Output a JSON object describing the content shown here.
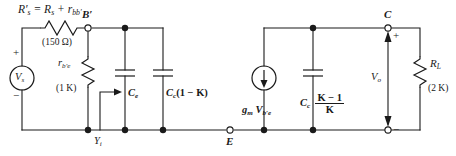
{
  "figure": {
    "kind": "circuit-schematic",
    "title_text": "",
    "background_color": "#ffffff",
    "ink_color": "#1a1a1a"
  },
  "source": {
    "name": "V",
    "sub": "s",
    "plus_sign": "+",
    "minus_sign": "−",
    "symbol": "voltage-source"
  },
  "series_resistor": {
    "label_main": "R",
    "label_main_sub": "s",
    "label_prime": "′",
    "equals": "=",
    "term1": "R",
    "term1_sub": "s",
    "plus": "+",
    "term2": "r",
    "term2_sub": "bb′",
    "value": "(150 Ω)",
    "full_text": "R′s = Rs + rbb′"
  },
  "nodes": {
    "b_prime": {
      "label": "B",
      "prime": "′",
      "style": "open-terminal"
    },
    "e": {
      "label": "E",
      "style": "open-terminal"
    },
    "c": {
      "label": "C",
      "style": "open-terminal"
    }
  },
  "input_resistor": {
    "label": "r",
    "label_sub": "b′e",
    "value": "(1 K)",
    "symbol": "resistor-zigzag"
  },
  "input_admittance": {
    "label": "Y",
    "label_sub": "i",
    "arrow": "arrow-right",
    "symbol": "input-admittance-marker"
  },
  "cap_ce": {
    "label": "C",
    "label_sub": "e",
    "symbol": "capacitor"
  },
  "cap_miller_input": {
    "label": "C",
    "label_sub": "c",
    "factor": "(1 − K)",
    "symbol": "capacitor"
  },
  "current_source": {
    "gm": "g",
    "gm_sub": "m",
    "v": "V",
    "v_sub": "b′e",
    "direction": "down",
    "symbol": "current-source"
  },
  "cap_miller_output": {
    "label": "C",
    "label_sub": "c",
    "numerator": "K − 1",
    "denominator": "K",
    "symbol": "capacitor"
  },
  "output_voltage": {
    "label": "V",
    "label_sub": "o",
    "plus_sign": "+",
    "minus_sign": "−"
  },
  "load_resistor": {
    "label": "R",
    "label_sub": "L",
    "value": "(2 K)",
    "symbol": "resistor-zigzag"
  }
}
